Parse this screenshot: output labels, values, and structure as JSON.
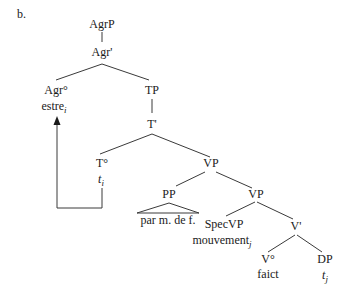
{
  "example_label": "b.",
  "nodes": {
    "agrp": "AgrP",
    "agr_bar": "Agr'",
    "agr_head": "Agr°",
    "agr_word": "estre",
    "agr_word_index": "i",
    "tp": "TP",
    "t_bar": "T'",
    "t_head": "T°",
    "t_trace": "t",
    "t_trace_index": "i",
    "vp_upper": "VP",
    "pp": "PP",
    "pp_content": "par m. de f.",
    "vp_lower": "VP",
    "specvp": "SpecVP",
    "specvp_word": "mouvement",
    "specvp_word_index": "j",
    "v_bar": "V'",
    "v_head": "V°",
    "v_word": "faict",
    "dp": "DP",
    "dp_trace": "t",
    "dp_trace_index": "j"
  },
  "movement_arrow": {
    "from": "T° trace t_i",
    "to": "Agr° estre_i"
  }
}
